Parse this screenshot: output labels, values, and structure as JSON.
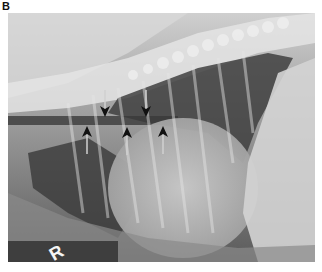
{
  "figure": {
    "panel_label": "B",
    "image_type": "lateral thoracic radiograph",
    "marker_letter": "R",
    "arrows": [
      {
        "direction": "down",
        "x": 105,
        "y": 108
      },
      {
        "direction": "down",
        "x": 146,
        "y": 108
      },
      {
        "direction": "up",
        "x": 87,
        "y": 131
      },
      {
        "direction": "up",
        "x": 127,
        "y": 132
      },
      {
        "direction": "up",
        "x": 163,
        "y": 131
      }
    ]
  }
}
